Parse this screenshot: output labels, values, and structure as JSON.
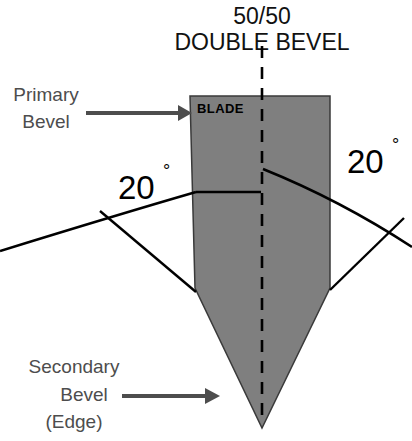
{
  "figure": {
    "title_line1": "50/50",
    "title_line2": "DOUBLE BEVEL",
    "blade_label": "BLADE",
    "angle_left": "20",
    "angle_right": "20",
    "degree_symbol": "°",
    "callouts": {
      "primary": {
        "line1": "Primary",
        "line2": "Bevel",
        "arrow_name": "primary-bevel-arrow"
      },
      "secondary": {
        "line1": "Secondary",
        "line2": "Bevel",
        "line3": "(Edge)",
        "arrow_name": "secondary-bevel-arrow"
      }
    },
    "colors": {
      "background": "#ffffff",
      "blade_fill": "#7f7f7f",
      "blade_stroke": "#000000",
      "line": "#000000",
      "callout_text": "#4d4d4d",
      "arrow": "#4d4d4d",
      "title_text": "#111111"
    }
  }
}
